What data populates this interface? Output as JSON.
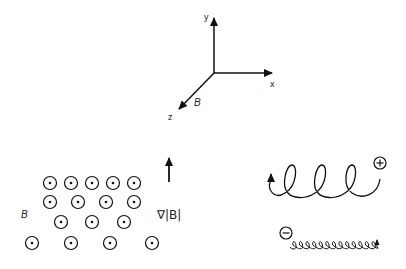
{
  "axes": {
    "x_label": "x",
    "y_label": "y",
    "z_label": "z",
    "field_label": "B"
  },
  "field_region": {
    "label": "B",
    "symbol": "out-of-page-dot-icon",
    "rows": [
      {
        "y": 183,
        "xs": [
          50,
          71,
          92,
          113,
          134
        ]
      },
      {
        "y": 202,
        "xs": [
          50,
          78,
          106,
          134
        ]
      },
      {
        "y": 222,
        "xs": [
          61,
          92,
          124
        ]
      },
      {
        "y": 243,
        "xs": [
          32,
          71,
          110,
          152
        ]
      }
    ]
  },
  "gradient": {
    "label": "∇|B|",
    "arrow": "up-arrow-icon"
  },
  "particles": {
    "positive": {
      "charge_symbol": "+",
      "description": "large-radius helix"
    },
    "negative": {
      "charge_symbol": "−",
      "description": "small-radius helix"
    }
  },
  "colors": {
    "ink": "#111111",
    "background": "#ffffff"
  }
}
